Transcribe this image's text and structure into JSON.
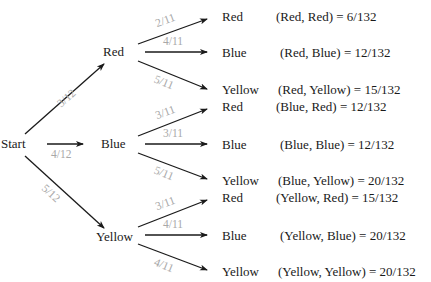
{
  "diagram": {
    "type": "probability-tree",
    "root": {
      "label": "Start"
    },
    "level1": [
      {
        "label": "Red",
        "prob": "3/12"
      },
      {
        "label": "Blue",
        "prob": "4/12"
      },
      {
        "label": "Yellow",
        "prob": "5/12"
      }
    ],
    "level2": [
      {
        "parent": "Red",
        "children": [
          {
            "label": "Red",
            "prob": "2/11",
            "outcome": "(Red, Red) = 6/132"
          },
          {
            "label": "Blue",
            "prob": "4/11",
            "outcome": "(Red, Blue) = 12/132"
          },
          {
            "label": "Yellow",
            "prob": "5/11",
            "outcome": "(Red, Yellow) = 15/132"
          }
        ]
      },
      {
        "parent": "Blue",
        "children": [
          {
            "label": "Red",
            "prob": "3/11",
            "outcome": "(Blue, Red) = 12/132"
          },
          {
            "label": "Blue",
            "prob": "3/11",
            "outcome": "(Blue, Blue) = 12/132"
          },
          {
            "label": "Yellow",
            "prob": "5/11",
            "outcome": "(Blue, Yellow) = 20/132"
          }
        ]
      },
      {
        "parent": "Yellow",
        "children": [
          {
            "label": "Red",
            "prob": "3/11",
            "outcome": "(Yellow, Red) = 15/132"
          },
          {
            "label": "Blue",
            "prob": "4/11",
            "outcome": "(Yellow, Blue) = 20/132"
          },
          {
            "label": "Yellow",
            "prob": "4/11",
            "outcome": "(Yellow, Yellow) = 20/132"
          }
        ]
      }
    ],
    "colors": {
      "edge": "#1a1a1a",
      "probability_label": "#a8a8a8",
      "text": "#1a1a1a"
    }
  }
}
